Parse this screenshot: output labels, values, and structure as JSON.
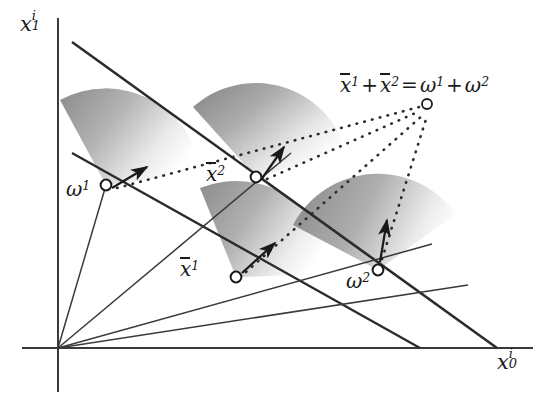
{
  "figure": {
    "domain": "economics-equilibrium-diagram",
    "width": 547,
    "height": 401,
    "background_color": "#ffffff",
    "ink_color": "#2b2b2b",
    "cone_fill_dark": "#8d8d8d",
    "cone_fill_light": "#ffffff"
  },
  "axes": {
    "y_label": {
      "base": "x",
      "sub": "1",
      "sup": "i"
    },
    "x_label": {
      "base": "x",
      "sub": "0",
      "sup": "i"
    },
    "origin": {
      "x": 58,
      "y": 348
    },
    "y_axis_top": 18,
    "x_axis_right": 533
  },
  "labels": {
    "omega1": {
      "base": "ω",
      "sup": "1"
    },
    "omega2": {
      "base": "ω",
      "sup": "2"
    },
    "xbar1": {
      "base": "x",
      "sup": "1",
      "bar": true
    },
    "xbar2": {
      "base": "x",
      "sup": "2",
      "bar": true
    },
    "aggregate_equation": {
      "terms": [
        "x̄1",
        "+",
        "x̄2",
        "=",
        "ω1",
        "+",
        "ω2"
      ],
      "plain": "x̄1 + x̄2 = ω1 + ω2"
    }
  },
  "points": [
    {
      "name": "omega1",
      "label": "ω¹",
      "x": 106,
      "y": 185,
      "marker": "open-circle"
    },
    {
      "name": "xbar2",
      "label": "x̄²",
      "x": 256,
      "y": 177,
      "marker": "open-circle"
    },
    {
      "name": "xbar1",
      "label": "x̄¹",
      "x": 236,
      "y": 277,
      "marker": "open-circle"
    },
    {
      "name": "omega2",
      "label": "ω²",
      "x": 378,
      "y": 270,
      "marker": "open-circle"
    },
    {
      "name": "aggregate",
      "label": "x̄¹ + x̄² = ω¹ + ω²",
      "x": 427,
      "y": 104,
      "marker": "open-circle"
    }
  ],
  "budget_lines": [
    {
      "name": "aggregate-budget-line",
      "from": {
        "x": 72,
        "y": 42
      },
      "to": {
        "x": 497,
        "y": 348
      }
    },
    {
      "name": "individual-budget-line",
      "from": {
        "x": 72,
        "y": 153
      },
      "to": {
        "x": 420,
        "y": 348
      }
    }
  ],
  "rays_from_origin": [
    {
      "name": "ray-to-omega1",
      "to": {
        "x": 106,
        "y": 185
      }
    },
    {
      "name": "ray-to-xbar2",
      "to": {
        "x": 291,
        "y": 153
      }
    },
    {
      "name": "ray-to-xbar1",
      "to": {
        "x": 430,
        "y": 243
      }
    },
    {
      "name": "ray-to-omega2",
      "to": {
        "x": 465,
        "y": 283
      }
    }
  ],
  "dotted_links": [
    {
      "name": "dotted-omega1-to-aggregate",
      "from": {
        "x": 116,
        "y": 188
      },
      "to": {
        "x": 421,
        "y": 107
      }
    },
    {
      "name": "dotted-xbar2-to-aggregate",
      "from": {
        "x": 266,
        "y": 178
      },
      "to": {
        "x": 422,
        "y": 110
      }
    },
    {
      "name": "dotted-xbar1-to-aggregate",
      "from": {
        "x": 244,
        "y": 272
      },
      "to": {
        "x": 425,
        "y": 114
      }
    },
    {
      "name": "dotted-omega2-to-aggregate",
      "from": {
        "x": 381,
        "y": 260
      },
      "to": {
        "x": 428,
        "y": 115
      }
    }
  ],
  "preference_cones": [
    {
      "name": "cone-omega1",
      "apex": {
        "x": 106,
        "y": 185
      },
      "start_angle": -118,
      "end_angle": -8,
      "radius": 96,
      "gradient_label": "gradient-arrow-omega1",
      "arrow_angle": -28,
      "arrow_length": 40
    },
    {
      "name": "cone-xbar2",
      "apex": {
        "x": 256,
        "y": 177
      },
      "start_angle": -132,
      "end_angle": -16,
      "radius": 94,
      "gradient_label": "gradient-arrow-xbar2",
      "arrow_angle": -62,
      "arrow_length": 42
    },
    {
      "name": "cone-xbar1",
      "apex": {
        "x": 236,
        "y": 277
      },
      "start_angle": -112,
      "end_angle": -2,
      "radius": 96,
      "gradient_label": "gradient-arrow-xbar1",
      "arrow_angle": -42,
      "arrow_length": 44
    },
    {
      "name": "cone-omega2",
      "apex": {
        "x": 378,
        "y": 270
      },
      "start_angle": -152,
      "end_angle": -36,
      "radius": 96,
      "gradient_label": "gradient-arrow-omega2",
      "arrow_angle": -78,
      "arrow_length": 44
    }
  ]
}
